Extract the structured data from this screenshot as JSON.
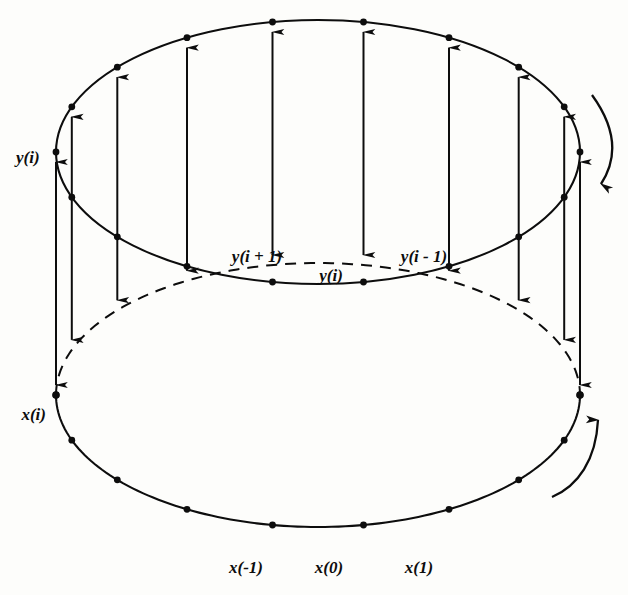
{
  "figure": {
    "type": "line-diagram",
    "background_color": "#fdfdfb",
    "stroke_color": "#0d0d0d"
  },
  "labels": {
    "y_i_left": "y(i)",
    "y_i_plus_1": "y(i + 1)",
    "y_i_center": "y(i)",
    "y_i_minus_1": "y(i - 1)",
    "x_i_left": "x(i)",
    "x_minus_1": "x(-1)",
    "x_0": "x(0)",
    "x_1": "x(1)"
  },
  "geometry": {
    "top_ellipse": {
      "cx": 318,
      "cy": 152,
      "rx": 262,
      "ry": 132
    },
    "bottom_ellipse": {
      "cx": 318,
      "cy": 395,
      "rx": 262,
      "ry": 132
    },
    "top_ellipse_style": "solid",
    "bottom_ellipse_front_style": "solid",
    "bottom_ellipse_back_style": "dashed"
  },
  "annotations": {
    "upper_curved_arrow_direction": "down",
    "lower_curved_arrow_direction": "up",
    "inner_top_arrows": "single-headed, pointing up",
    "vertical_connector_arrows": "double-headed, up and down"
  },
  "chart_data": {
    "type": "scatter",
    "series": [
      {
        "name": "top-circle-points",
        "count": 18,
        "description": "evenly spaced points around upper ellipse"
      },
      {
        "name": "bottom-circle-points",
        "count": 18,
        "description": "evenly spaced points around lower ellipse"
      }
    ],
    "xlabel": "",
    "ylabel": ""
  }
}
